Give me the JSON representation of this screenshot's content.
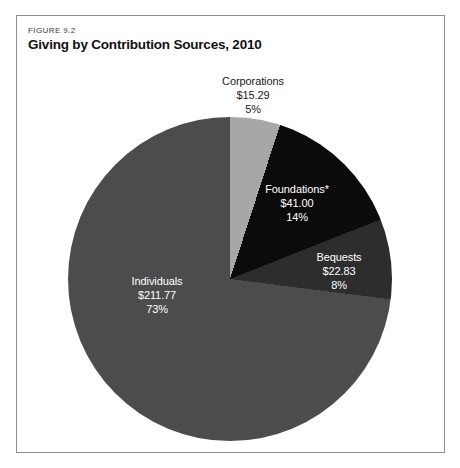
{
  "figure": {
    "eyebrow": "FIGURE 9.2",
    "title": "Giving by Contribution Sources, 2010"
  },
  "chart_data": {
    "type": "pie",
    "title": "Giving by Contribution Sources, 2010",
    "direction": "clockwise",
    "start_angle_deg": 0,
    "legend": "none",
    "labels_on_chart": true,
    "segments": [
      {
        "label": "Corporations",
        "value": 15.29,
        "amount": "$15.29",
        "percent": 5,
        "percent_label": "5%",
        "color": "#a7a7a7",
        "label_color": "#1a1a1a"
      },
      {
        "label": "Foundations*",
        "value": 41.0,
        "amount": "$41.00",
        "percent": 14,
        "percent_label": "14%",
        "color": "#0b0b0b",
        "label_color": "#ffffff"
      },
      {
        "label": "Bequests",
        "value": 22.83,
        "amount": "$22.83",
        "percent": 8,
        "percent_label": "8%",
        "color": "#2d2d2d",
        "label_color": "#ffffff"
      },
      {
        "label": "Individuals",
        "value": 211.77,
        "amount": "$211.77",
        "percent": 73,
        "percent_label": "73%",
        "color": "#4c4c4c",
        "label_color": "#ffffff"
      }
    ],
    "panel_border_color": "#8f8f8f"
  }
}
